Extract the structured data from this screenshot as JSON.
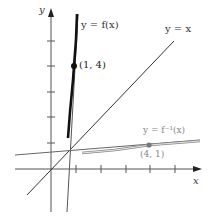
{
  "diagram": {
    "axes": {
      "x_label": "x",
      "y_label": "y"
    },
    "curves": {
      "f": {
        "label": "y = f(x)",
        "point_label": "(1, 4)"
      },
      "identity": {
        "label": "y = x"
      },
      "f_inverse": {
        "label": "y = f⁻¹(x)",
        "point_label": "(4, 1)"
      }
    },
    "colors": {
      "f": "#1a1a1a",
      "axes": "#555555",
      "inverse": "#888888",
      "identity": "#333333"
    }
  }
}
